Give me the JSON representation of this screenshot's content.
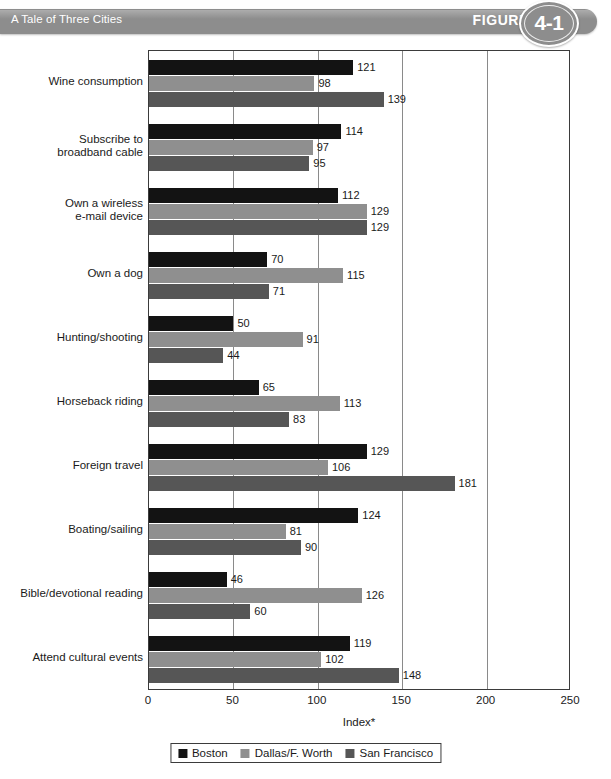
{
  "header": {
    "title": "A Tale of Three Cities",
    "figure_label": "FIGURE",
    "figure_number": "4-1",
    "bar_color": "#8d8d8d",
    "text_color": "#ffffff"
  },
  "chart_data": {
    "type": "bar",
    "orientation": "horizontal",
    "title": "A Tale of Three Cities",
    "xlabel": "Index*",
    "ylabel": "",
    "xlim": [
      0,
      250
    ],
    "xticks": [
      0,
      50,
      100,
      150,
      200,
      250
    ],
    "xtick_labels": [
      "0",
      "50",
      "100",
      "150",
      "200",
      "250"
    ],
    "grid": true,
    "grid_axis": "x",
    "legend_position": "bottom",
    "categories": [
      "Wine consumption",
      "Subscribe to\nbroadband cable",
      "Own a wireless\ne-mail device",
      "Own a dog",
      "Hunting/shooting",
      "Horseback riding",
      "Foreign travel",
      "Boating/sailing",
      "Bible/devotional reading",
      "Attend cultural events"
    ],
    "series": [
      {
        "name": "Boston",
        "color": "#131313",
        "values": [
          121,
          114,
          112,
          70,
          50,
          65,
          129,
          124,
          46,
          119
        ]
      },
      {
        "name": "Dallas/F. Worth",
        "color": "#8f8f8f",
        "values": [
          98,
          97,
          129,
          115,
          91,
          113,
          106,
          81,
          126,
          102
        ]
      },
      {
        "name": "San Francisco",
        "color": "#565656",
        "values": [
          139,
          95,
          129,
          71,
          44,
          83,
          181,
          90,
          60,
          148
        ]
      }
    ]
  }
}
